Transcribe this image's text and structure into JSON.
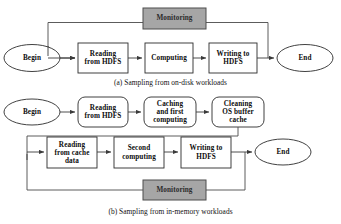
{
  "figure": {
    "title_a": "(a) Sampling from on-disk workloads",
    "title_b": "(b) Sampling from in-memory workloads",
    "colors": {
      "monitor_fill": "#a6a6a6",
      "monitor_stroke": "#4d4d4d",
      "node_stroke": "#2b2b2b",
      "line": "#4a4a4a",
      "text": "#0d0d0d",
      "background": "#ffffff"
    }
  },
  "diagram_a": {
    "caption": "(a) Sampling from on-disk workloads",
    "monitoring": {
      "label": "Monitoring"
    },
    "nodes": [
      {
        "id": "begin_a",
        "label": "Begin",
        "shape": "ellipse"
      },
      {
        "id": "reading_a",
        "label": "Reading\nfrom HDFS",
        "shape": "rect"
      },
      {
        "id": "computing_a",
        "label": "Computing",
        "shape": "rect"
      },
      {
        "id": "writing_a",
        "label": "Writing to\nHDFS",
        "shape": "rect"
      },
      {
        "id": "end_a",
        "label": "End",
        "shape": "ellipse"
      }
    ],
    "node_text": {
      "begin": "Begin",
      "reading_line1": "Reading",
      "reading_line2": "from HDFS",
      "computing": "Computing",
      "writing_line1": "Writing to",
      "writing_line2": "HDFS",
      "end": "End",
      "monitoring": "Monitoring"
    },
    "edges": [
      {
        "from": "begin_a",
        "to": "reading_a",
        "type": "arrow"
      },
      {
        "from": "reading_a",
        "to": "computing_a",
        "type": "arrow"
      },
      {
        "from": "computing_a",
        "to": "writing_a",
        "type": "arrow"
      },
      {
        "from": "writing_a",
        "to": "end_a",
        "type": "arrow"
      },
      {
        "from": "monitoring",
        "to": "reading_a",
        "type": "feedback-left"
      },
      {
        "from": "writing_a",
        "to": "monitoring",
        "type": "feedback-right"
      }
    ]
  },
  "diagram_b": {
    "caption": "(b) Sampling from in-memory workloads",
    "monitoring": {
      "label": "Monitoring"
    },
    "nodes": [
      {
        "id": "begin_b",
        "label": "Begin",
        "shape": "ellipse"
      },
      {
        "id": "reading_b",
        "label": "Reading\nfrom HDFS",
        "shape": "roundrect"
      },
      {
        "id": "caching_b",
        "label": "Caching\nand first\ncomputing",
        "shape": "roundrect"
      },
      {
        "id": "cleaning_b",
        "label": "Cleaning\nOS buffer\ncache",
        "shape": "roundrect"
      },
      {
        "id": "readcache_b",
        "label": "Reading\nfrom cache\ndata",
        "shape": "rect"
      },
      {
        "id": "second_b",
        "label": "Second\ncomputing",
        "shape": "rect"
      },
      {
        "id": "writing_b",
        "label": "Writing to\nHDFS",
        "shape": "rect"
      },
      {
        "id": "end_b",
        "label": "End",
        "shape": "ellipse"
      }
    ],
    "node_text": {
      "begin": "Begin",
      "reading_line1": "Reading",
      "reading_line2": "from HDFS",
      "caching_line1": "Caching",
      "caching_line2": "and first",
      "caching_line3": "computing",
      "cleaning_line1": "Cleaning",
      "cleaning_line2": "OS buffer",
      "cleaning_line3": "cache",
      "readcache_line1": "Reading",
      "readcache_line2": "from cache",
      "readcache_line3": "data",
      "second_line1": "Second",
      "second_line2": "computing",
      "writing_line1": "Writing to",
      "writing_line2": "HDFS",
      "end": "End",
      "monitoring": "Monitoring"
    },
    "edges": [
      {
        "from": "begin_b",
        "to": "reading_b",
        "type": "arrow"
      },
      {
        "from": "reading_b",
        "to": "caching_b",
        "type": "arrow"
      },
      {
        "from": "caching_b",
        "to": "cleaning_b",
        "type": "arrow"
      },
      {
        "from": "cleaning_b",
        "to": "readcache_b",
        "type": "wrap"
      },
      {
        "from": "readcache_b",
        "to": "second_b",
        "type": "arrow"
      },
      {
        "from": "second_b",
        "to": "writing_b",
        "type": "arrow"
      },
      {
        "from": "writing_b",
        "to": "end_b",
        "type": "arrow"
      },
      {
        "from": "monitoring",
        "to": "readcache_b",
        "type": "feedback-left"
      },
      {
        "from": "writing_b",
        "to": "monitoring",
        "type": "feedback-right"
      }
    ]
  }
}
